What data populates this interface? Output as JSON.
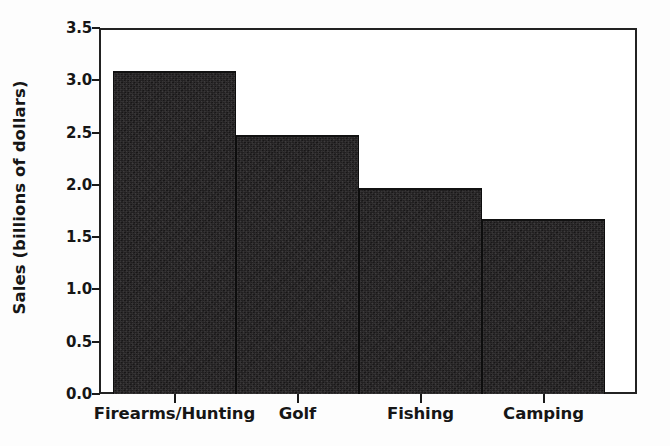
{
  "chart_data": {
    "type": "bar",
    "title": "",
    "xlabel": "",
    "ylabel": "Sales (billions of dollars)",
    "categories": [
      "Firearms/Hunting",
      "Golf",
      "Fishing",
      "Camping"
    ],
    "values": [
      3.09,
      2.48,
      1.97,
      1.67
    ],
    "ylim": [
      0.0,
      3.5
    ],
    "yticks": [
      "0.0",
      "0.5",
      "1.0",
      "1.5",
      "2.0",
      "2.5",
      "3.0",
      "3.5"
    ],
    "ytick_values": [
      0.0,
      0.5,
      1.0,
      1.5,
      2.0,
      2.5,
      3.0,
      3.5
    ],
    "grid": false,
    "legend": "none",
    "bar_color": "#211f20",
    "axis_color": "#222222",
    "text_color": "#161616",
    "background": "#ffffff"
  }
}
